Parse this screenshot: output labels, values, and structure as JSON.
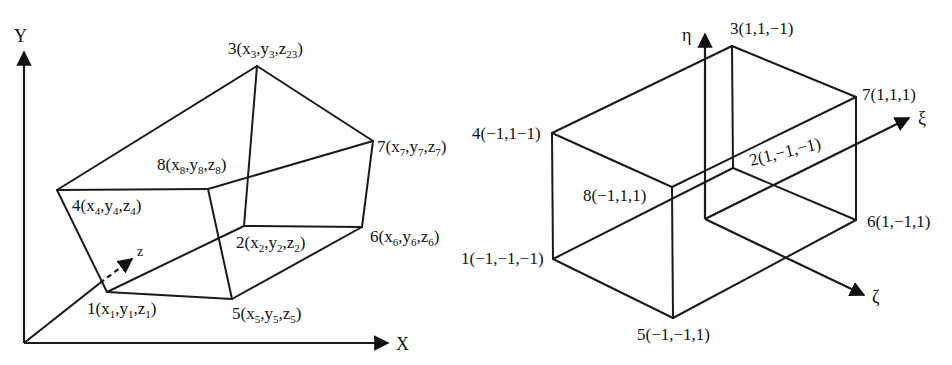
{
  "left_diagram": {
    "name": "physical-hexahedral-element",
    "axes": {
      "x": "X",
      "y": "Y",
      "z": "z"
    },
    "nodes": [
      {
        "id": "1",
        "label": "1",
        "coords": [
          "x",
          "y",
          "z"
        ],
        "subs": [
          "1",
          "1",
          "1"
        ]
      },
      {
        "id": "2",
        "label": "2",
        "coords": [
          "x",
          "y",
          "z"
        ],
        "subs": [
          "2",
          "2",
          "2"
        ]
      },
      {
        "id": "3",
        "label": "3",
        "coords": [
          "x",
          "y",
          "z"
        ],
        "subs": [
          "3",
          "3",
          "23"
        ]
      },
      {
        "id": "4",
        "label": "4",
        "coords": [
          "x",
          "y",
          "z"
        ],
        "subs": [
          "4",
          "4",
          "4"
        ]
      },
      {
        "id": "5",
        "label": "5",
        "coords": [
          "x",
          "y",
          "z"
        ],
        "subs": [
          "5",
          "5",
          "5"
        ]
      },
      {
        "id": "6",
        "label": "6",
        "coords": [
          "x",
          "y",
          "z"
        ],
        "subs": [
          "6",
          "6",
          "6"
        ]
      },
      {
        "id": "7",
        "label": "7",
        "coords": [
          "x",
          "y",
          "z"
        ],
        "subs": [
          "7",
          "7",
          "7"
        ]
      },
      {
        "id": "8",
        "label": "8",
        "coords": [
          "x",
          "y",
          "z"
        ],
        "subs": [
          "8",
          "8",
          "8"
        ]
      }
    ]
  },
  "right_diagram": {
    "name": "natural-coordinate-cube",
    "axes": {
      "xi": "ξ",
      "eta": "η",
      "zeta": "ζ"
    },
    "nodes": [
      {
        "id": "1",
        "text": "1(−1,−1,−1)"
      },
      {
        "id": "2",
        "text": "2(1,−1,−1)"
      },
      {
        "id": "3",
        "text": "3(1,1,−1)"
      },
      {
        "id": "4",
        "text": "4(−1,1−1)"
      },
      {
        "id": "5",
        "text": "5(−1,−1,1)"
      },
      {
        "id": "6",
        "text": "6(1,−1,1)"
      },
      {
        "id": "7",
        "text": "7(1,1,1)"
      },
      {
        "id": "8",
        "text": "8(−1,1,1)"
      }
    ]
  }
}
